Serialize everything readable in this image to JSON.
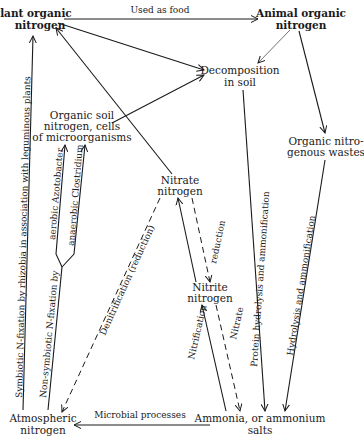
{
  "diagram": {
    "nodes": {
      "plant_organic": {
        "line1": "Plant organic",
        "line2": "nitrogen"
      },
      "animal_organic": {
        "line1": "Animal organic",
        "line2": "nitrogen"
      },
      "decomposition": {
        "line1": "Decomposition",
        "line2": "in soil"
      },
      "organic_soil": {
        "line1": "Organic soil",
        "line2": "nitrogen, cells",
        "line3": "of microorganisms"
      },
      "organic_wastes": {
        "line1": "Organic nitro-",
        "line2": "genous wastes"
      },
      "nitrate": {
        "line1": "Nitrate",
        "line2": "nitrogen"
      },
      "nitrite": {
        "line1": "Nitrite",
        "line2": "nitrogen"
      },
      "atmospheric": {
        "line1": "Atmospheric",
        "line2": "nitrogen"
      },
      "ammonia": {
        "line1": "Ammonia, or ammonium",
        "line2": "salts"
      }
    },
    "edges": {
      "used_as_food": "Used as food",
      "symbiotic": "Symbiotic N-fixation by rhizobia in association with leguminous plants",
      "non_symbiotic": "Non-symbiotic N-fixation by",
      "aerobic": "aerobic Azotobacter",
      "anaerobic": "anaerobic Clostridium",
      "denitrification": "Denitrification (reduction)",
      "nitrification": "Nitrification",
      "nitrate_reduction_a": "Nitrate",
      "nitrate_reduction_b": "reduction",
      "protein_hydrolysis": "Protein hydrolysis and ammonification",
      "hydrolysis": "Hydrolysis and ammonification",
      "microbial": "Microbial processes"
    }
  }
}
